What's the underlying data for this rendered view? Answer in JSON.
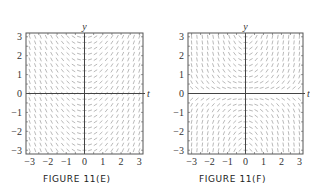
{
  "chart_data": [
    {
      "type": "slope-field",
      "title": "FIGURE 11(E)",
      "equation": "y' = t",
      "xlabel": "t",
      "ylabel": "y",
      "xlim": [
        -3.2,
        3.2
      ],
      "ylim": [
        -3.2,
        3.2
      ],
      "xticks": [
        "−3",
        "−2",
        "−1",
        "0",
        "1",
        "2",
        "3"
      ],
      "xtick_values": [
        -3,
        -2,
        -1,
        0,
        1,
        2,
        3
      ],
      "yticks": [
        "3",
        "2",
        "1",
        "0",
        "−1",
        "−2",
        "−3"
      ],
      "ytick_values": [
        3,
        2,
        1,
        0,
        -1,
        -2,
        -3
      ],
      "grid_step": 0.3,
      "grid": false
    },
    {
      "type": "slope-field",
      "title": "FIGURE 11(F)",
      "equation": "y' = t·y",
      "xlabel": "t",
      "ylabel": "y",
      "xlim": [
        -3.2,
        3.2
      ],
      "ylim": [
        -3.2,
        3.2
      ],
      "xticks": [
        "−3",
        "−2",
        "−1",
        "0",
        "1",
        "2",
        "3"
      ],
      "xtick_values": [
        -3,
        -2,
        -1,
        0,
        1,
        2,
        3
      ],
      "yticks": [
        "3",
        "2",
        "1",
        "0",
        "−1",
        "−2",
        "−3"
      ],
      "ytick_values": [
        3,
        2,
        1,
        0,
        -1,
        -2,
        -3
      ],
      "grid_step": 0.3,
      "grid": false
    }
  ],
  "colors": {
    "segment": "#8a8a8a",
    "axis": "#444444",
    "frame": "#555555",
    "text": "#333333"
  }
}
